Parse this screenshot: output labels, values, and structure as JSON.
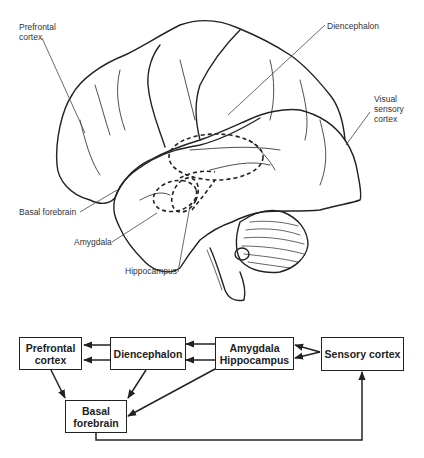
{
  "brain_labels": {
    "prefrontal_cortex": [
      "Prefrontal",
      "cortex"
    ],
    "diencephalon": "Diencephalon",
    "visual_sensory_cortex": [
      "Visual",
      "sensory",
      "cortex"
    ],
    "basal_forebrain": "Basal forebrain",
    "amygdala": "Amygdala",
    "hippocampus": "Hippocampus"
  },
  "flowchart": {
    "nodes": {
      "prefrontal": [
        "Prefrontal",
        "cortex"
      ],
      "diencephalon": "Diencephalon",
      "amygdala_hippocampus": [
        "Amygdala",
        "Hippocampus"
      ],
      "sensory": "Sensory cortex",
      "basal": [
        "Basal",
        "forebrain"
      ]
    },
    "edges": [
      {
        "from": "Diencephalon",
        "to": "Prefrontal cortex",
        "count": 2
      },
      {
        "from": "Amygdala Hippocampus",
        "to": "Diencephalon",
        "count": 2
      },
      {
        "from": "Sensory cortex",
        "to": "Amygdala Hippocampus",
        "count": 2
      },
      {
        "from": "Prefrontal cortex",
        "to": "Basal forebrain"
      },
      {
        "from": "Diencephalon",
        "to": "Basal forebrain"
      },
      {
        "from": "Amygdala Hippocampus",
        "to": "Basal forebrain"
      },
      {
        "from": "Basal forebrain",
        "to": "Sensory cortex"
      }
    ]
  }
}
